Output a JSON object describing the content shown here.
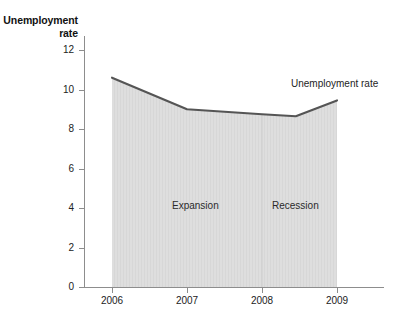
{
  "chart_data": {
    "type": "area",
    "title": "",
    "subtitle": "",
    "xlabel": "",
    "ylabel": "Unemployment rate",
    "ylabel_line1": "Unemployment",
    "ylabel_line2": "rate",
    "x": [
      2006,
      2007,
      2008,
      2008.45,
      2009
    ],
    "xtick_labels": [
      "2006",
      "2007",
      "2008",
      "2009"
    ],
    "xtick_values": [
      2006,
      2007,
      2008,
      2009
    ],
    "ytick_labels": [
      "0",
      "2",
      "4",
      "6",
      "8",
      "10",
      "12"
    ],
    "ytick_values": [
      0,
      2,
      4,
      6,
      8,
      10,
      12
    ],
    "xlim": [
      2006,
      2009
    ],
    "ylim": [
      0,
      12
    ],
    "grid": false,
    "legend_position": "inline-annotation",
    "series": [
      {
        "name": "Unemployment rate",
        "values": [
          10.6,
          9.0,
          8.75,
          8.65,
          9.45
        ],
        "line_color": "#555555",
        "fill_color": "#dedede"
      }
    ],
    "annotations": [
      {
        "name": "series-label",
        "text": "Unemployment rate",
        "x": 2008.55,
        "y": 10.8
      },
      {
        "name": "expansion-region",
        "text": "Expansion",
        "x": 2007.2,
        "y": 4.4
      },
      {
        "name": "recession-region",
        "text": "Recession",
        "x": 2008.45,
        "y": 4.4
      }
    ],
    "regions": [
      {
        "name": "Expansion",
        "x_start": 2006,
        "x_end": 2008
      },
      {
        "name": "Recession",
        "x_start": 2008,
        "x_end": 2009
      }
    ]
  },
  "axes": {
    "y_title_line1": "Unemployment",
    "y_title_line2": "rate",
    "y_ticks": [
      "12",
      "10",
      "8",
      "6",
      "4",
      "2",
      "0"
    ],
    "x_ticks": [
      "2006",
      "2007",
      "2008",
      "2009"
    ]
  },
  "labels": {
    "series_annotation": "Unemployment rate",
    "expansion": "Expansion",
    "recession": "Recession"
  },
  "colors": {
    "area_fill": "#dedede",
    "line": "#555555",
    "axis": "#8d8d8d",
    "text": "#222222",
    "background": "#ffffff",
    "divider": "#cfcfcf"
  }
}
